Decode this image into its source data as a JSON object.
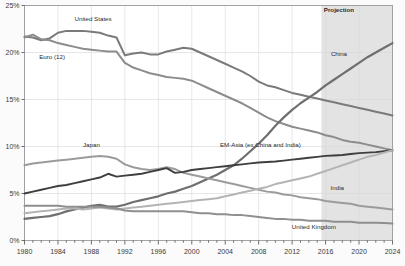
{
  "chart_data": {
    "type": "line",
    "title": "",
    "subtitle": "",
    "xlabel": "",
    "ylabel": "",
    "xlim": [
      1980,
      2024
    ],
    "ylim": [
      0,
      25
    ],
    "grid": true,
    "legend_position": "inline-annotations",
    "y_tick_labels": [
      "0%",
      "5%",
      "10%",
      "15%",
      "20%",
      "25%"
    ],
    "y_tick_values": [
      0,
      5,
      10,
      15,
      20,
      25
    ],
    "x_tick_labels": [
      "1980",
      "1984",
      "1988",
      "1992",
      "1996",
      "2000",
      "2004",
      "2008",
      "2012",
      "2016",
      "2020",
      "2024"
    ],
    "x_tick_values": [
      1980,
      1984,
      1988,
      1992,
      1996,
      2000,
      2004,
      2008,
      2012,
      2016,
      2020,
      2024
    ],
    "x_minor_tick_step": 1,
    "shaded_region": {
      "label": "Projection",
      "start": 2015.5,
      "end": 2024,
      "color": "#e3e3e3"
    },
    "annotations": [
      {
        "name": "united-states",
        "text": "United States",
        "x": 1988.2,
        "y": 23.3
      },
      {
        "name": "euro-12",
        "text": "Euro (12)",
        "x": 1983.3,
        "y": 19.3
      },
      {
        "name": "japan",
        "text": "Japan",
        "x": 1988.0,
        "y": 9.9
      },
      {
        "name": "china",
        "text": "China",
        "x": 2017.6,
        "y": 19.6
      },
      {
        "name": "projection",
        "text": "Projection",
        "x": 2017.6,
        "y": 24.3
      },
      {
        "name": "em-asia",
        "text": "EM-Asia (ex China and India)",
        "x": 2008.2,
        "y": 9.9
      },
      {
        "name": "india",
        "text": "India",
        "x": 2017.4,
        "y": 5.4
      },
      {
        "name": "united-kingdom",
        "text": "United Kingdom",
        "x": 2014.6,
        "y": 1.25
      }
    ],
    "series": [
      {
        "name": "United States",
        "color": "#7a7a7a",
        "width": 2.0,
        "x": [
          1980,
          1981,
          1982,
          1983,
          1984,
          1985,
          1986,
          1987,
          1988,
          1989,
          1990,
          1991,
          1992,
          1993,
          1994,
          1995,
          1996,
          1997,
          1998,
          1999,
          2000,
          2001,
          2002,
          2003,
          2004,
          2005,
          2006,
          2007,
          2008,
          2009,
          2010,
          2011,
          2012,
          2013,
          2014,
          2015,
          2016,
          2017,
          2018,
          2019,
          2020,
          2021,
          2022,
          2023,
          2024
        ],
        "values": [
          21.7,
          21.6,
          21.3,
          21.5,
          22.1,
          22.3,
          22.3,
          22.3,
          22.2,
          22.1,
          21.8,
          21.6,
          19.7,
          19.9,
          20.0,
          19.8,
          19.8,
          20.1,
          20.3,
          20.5,
          20.4,
          20.0,
          19.6,
          19.2,
          18.8,
          18.4,
          18.0,
          17.5,
          16.9,
          16.5,
          16.3,
          16.0,
          15.7,
          15.5,
          15.3,
          15.1,
          14.9,
          14.7,
          14.5,
          14.3,
          14.1,
          13.9,
          13.7,
          13.5,
          13.3
        ]
      },
      {
        "name": "Euro (12)",
        "color": "#8c8c8c",
        "width": 2.0,
        "x": [
          1980,
          1981,
          1982,
          1983,
          1984,
          1985,
          1986,
          1987,
          1988,
          1989,
          1990,
          1991,
          1992,
          1993,
          1994,
          1995,
          1996,
          1997,
          1998,
          1999,
          2000,
          2001,
          2002,
          2003,
          2004,
          2005,
          2006,
          2007,
          2008,
          2009,
          2010,
          2011,
          2012,
          2013,
          2014,
          2015,
          2016,
          2017,
          2018,
          2019,
          2020,
          2021,
          2022,
          2023,
          2024
        ],
        "values": [
          21.6,
          21.9,
          21.4,
          21.3,
          21.0,
          20.8,
          20.6,
          20.4,
          20.3,
          20.2,
          20.1,
          20.1,
          18.9,
          18.4,
          18.1,
          17.8,
          17.6,
          17.4,
          17.3,
          17.2,
          17.0,
          16.6,
          16.2,
          15.8,
          15.4,
          15.0,
          14.6,
          14.1,
          13.6,
          13.1,
          12.7,
          12.4,
          12.1,
          11.9,
          11.7,
          11.5,
          11.2,
          11.0,
          10.7,
          10.5,
          10.4,
          10.2,
          10.0,
          9.8,
          9.6
        ]
      },
      {
        "name": "China",
        "color": "#6f6f6f",
        "width": 2.2,
        "x": [
          1980,
          1981,
          1982,
          1983,
          1984,
          1985,
          1986,
          1987,
          1988,
          1989,
          1990,
          1991,
          1992,
          1993,
          1994,
          1995,
          1996,
          1997,
          1998,
          1999,
          2000,
          2001,
          2002,
          2003,
          2004,
          2005,
          2006,
          2007,
          2008,
          2009,
          2010,
          2011,
          2012,
          2013,
          2014,
          2015,
          2016,
          2017,
          2018,
          2019,
          2020,
          2021,
          2022,
          2023,
          2024
        ],
        "values": [
          2.3,
          2.4,
          2.5,
          2.6,
          2.8,
          3.1,
          3.3,
          3.5,
          3.7,
          3.8,
          3.6,
          3.6,
          3.8,
          4.1,
          4.3,
          4.5,
          4.7,
          5.0,
          5.2,
          5.5,
          5.8,
          6.2,
          6.6,
          7.0,
          7.5,
          8.0,
          8.7,
          9.5,
          10.3,
          11.2,
          12.2,
          13.1,
          13.9,
          14.6,
          15.2,
          15.8,
          16.5,
          17.1,
          17.7,
          18.3,
          18.9,
          19.5,
          20.0,
          20.5,
          21.0
        ]
      },
      {
        "name": "Japan",
        "color": "#9b9b9b",
        "width": 2.0,
        "x": [
          1980,
          1981,
          1982,
          1983,
          1984,
          1985,
          1986,
          1987,
          1988,
          1989,
          1990,
          1991,
          1992,
          1993,
          1994,
          1995,
          1996,
          1997,
          1998,
          1999,
          2000,
          2001,
          2002,
          2003,
          2004,
          2005,
          2006,
          2007,
          2008,
          2009,
          2010,
          2011,
          2012,
          2013,
          2014,
          2015,
          2016,
          2017,
          2018,
          2019,
          2020,
          2021,
          2022,
          2023,
          2024
        ],
        "values": [
          8.0,
          8.2,
          8.3,
          8.4,
          8.5,
          8.6,
          8.7,
          8.8,
          8.9,
          9.0,
          8.9,
          8.7,
          8.1,
          7.8,
          7.6,
          7.5,
          7.6,
          7.8,
          7.6,
          7.2,
          7.0,
          6.8,
          6.6,
          6.4,
          6.2,
          6.0,
          5.8,
          5.6,
          5.4,
          5.2,
          5.1,
          4.9,
          4.8,
          4.6,
          4.5,
          4.4,
          4.2,
          4.1,
          4.0,
          3.9,
          3.7,
          3.6,
          3.5,
          3.4,
          3.3
        ]
      },
      {
        "name": "EM-Asia (ex China and India)",
        "color": "#3f3f3f",
        "width": 1.9,
        "x": [
          1980,
          1981,
          1982,
          1983,
          1984,
          1985,
          1986,
          1987,
          1988,
          1989,
          1990,
          1991,
          1992,
          1993,
          1994,
          1995,
          1996,
          1997,
          1998,
          1999,
          2000,
          2001,
          2002,
          2003,
          2004,
          2005,
          2006,
          2007,
          2008,
          2009,
          2010,
          2011,
          2012,
          2013,
          2014,
          2015,
          2016,
          2017,
          2018,
          2019,
          2020,
          2021,
          2022,
          2023,
          2024
        ],
        "values": [
          5.0,
          5.2,
          5.4,
          5.6,
          5.8,
          5.9,
          6.1,
          6.3,
          6.5,
          6.7,
          7.1,
          6.8,
          6.9,
          7.0,
          7.1,
          7.3,
          7.5,
          7.7,
          7.2,
          7.3,
          7.5,
          7.6,
          7.7,
          7.8,
          7.9,
          8.0,
          8.1,
          8.2,
          8.3,
          8.35,
          8.4,
          8.5,
          8.6,
          8.7,
          8.8,
          8.9,
          9.0,
          9.05,
          9.1,
          9.2,
          9.3,
          9.35,
          9.4,
          9.5,
          9.6
        ]
      },
      {
        "name": "India",
        "color": "#b4b4b4",
        "width": 2.0,
        "x": [
          1980,
          1981,
          1982,
          1983,
          1984,
          1985,
          1986,
          1987,
          1988,
          1989,
          1990,
          1991,
          1992,
          1993,
          1994,
          1995,
          1996,
          1997,
          1998,
          1999,
          2000,
          2001,
          2002,
          2003,
          2004,
          2005,
          2006,
          2007,
          2008,
          2009,
          2010,
          2011,
          2012,
          2013,
          2014,
          2015,
          2016,
          2017,
          2018,
          2019,
          2020,
          2021,
          2022,
          2023,
          2024
        ],
        "values": [
          2.9,
          3.0,
          3.1,
          3.2,
          3.3,
          3.4,
          3.4,
          3.3,
          3.4,
          3.5,
          3.4,
          3.3,
          3.4,
          3.5,
          3.6,
          3.7,
          3.8,
          3.9,
          4.0,
          4.1,
          4.2,
          4.3,
          4.4,
          4.5,
          4.7,
          4.9,
          5.1,
          5.3,
          5.5,
          5.7,
          6.0,
          6.2,
          6.4,
          6.6,
          6.8,
          7.1,
          7.4,
          7.7,
          8.0,
          8.3,
          8.6,
          8.9,
          9.1,
          9.35,
          9.6
        ]
      },
      {
        "name": "United Kingdom",
        "color": "#8f8f8f",
        "width": 2.0,
        "x": [
          1980,
          1981,
          1982,
          1983,
          1984,
          1985,
          1986,
          1987,
          1988,
          1989,
          1990,
          1991,
          1992,
          1993,
          1994,
          1995,
          1996,
          1997,
          1998,
          1999,
          2000,
          2001,
          2002,
          2003,
          2004,
          2005,
          2006,
          2007,
          2008,
          2009,
          2010,
          2011,
          2012,
          2013,
          2014,
          2015,
          2016,
          2017,
          2018,
          2019,
          2020,
          2021,
          2022,
          2023,
          2024
        ],
        "values": [
          3.7,
          3.7,
          3.7,
          3.7,
          3.7,
          3.6,
          3.6,
          3.6,
          3.6,
          3.6,
          3.5,
          3.4,
          3.2,
          3.1,
          3.1,
          3.1,
          3.1,
          3.1,
          3.1,
          3.1,
          3.0,
          2.9,
          2.9,
          2.8,
          2.8,
          2.7,
          2.7,
          2.6,
          2.5,
          2.4,
          2.3,
          2.3,
          2.2,
          2.2,
          2.1,
          2.1,
          2.1,
          2.0,
          2.0,
          2.0,
          1.9,
          1.9,
          1.9,
          1.85,
          1.8
        ]
      }
    ]
  },
  "meta": {
    "axis_color": "#9a9a9a",
    "grid_color": "#d6d6d6",
    "background": "#fbfbfb",
    "plot_background": "#ffffff"
  }
}
